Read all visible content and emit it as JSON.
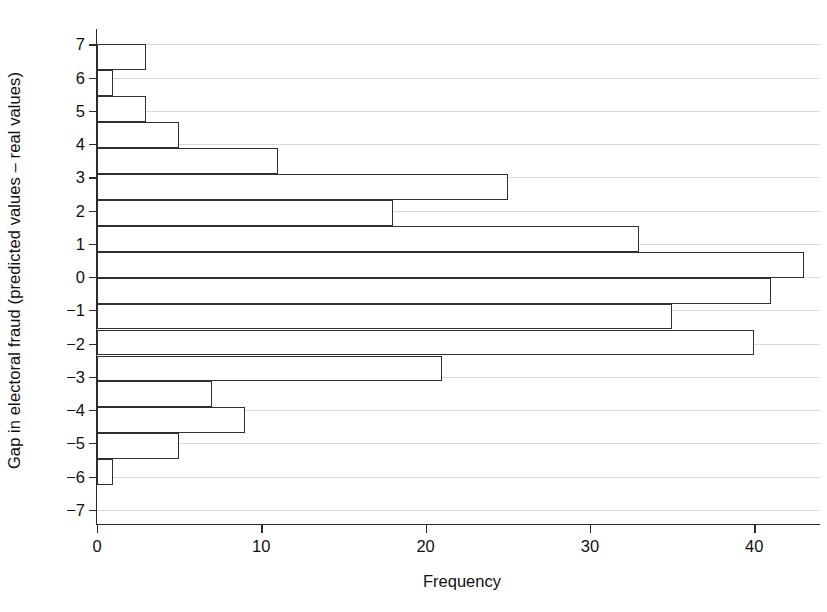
{
  "chart_data": {
    "type": "bar",
    "orientation": "horizontal",
    "title": "",
    "xlabel": "Frequency",
    "ylabel": "Gap in electoral fraud (predicted values – real values)",
    "xlim": [
      0,
      44
    ],
    "ylim": [
      -7.4,
      7.4
    ],
    "xticks": [
      0,
      10,
      20,
      30,
      40
    ],
    "xtick_labels": [
      "0",
      "10",
      "20",
      "30",
      "40"
    ],
    "yticks": [
      7,
      6,
      5,
      4,
      3,
      2,
      1,
      0,
      -1,
      -2,
      -3,
      -4,
      -5,
      -6,
      -7
    ],
    "ytick_labels": [
      "7",
      "6",
      "5",
      "4",
      "3",
      "2",
      "1",
      "0",
      "−1",
      "−2",
      "−3",
      "−4",
      "−5",
      "−6",
      "−7"
    ],
    "grid": true,
    "grid_axis": "y",
    "grid_color": "#dadada",
    "bar_edge_color": "#2f2f2f",
    "bar_fill_color": "#ffffff",
    "legend": null,
    "bin_width": 0.78,
    "bins": [
      {
        "center": 6.6,
        "low": 6.22,
        "high": 7.0,
        "value": 3
      },
      {
        "center": 5.83,
        "low": 5.44,
        "high": 6.22,
        "value": 1
      },
      {
        "center": 5.05,
        "low": 4.66,
        "high": 5.44,
        "value": 3
      },
      {
        "center": 4.27,
        "low": 3.88,
        "high": 4.66,
        "value": 5
      },
      {
        "center": 3.49,
        "low": 3.1,
        "high": 3.88,
        "value": 11
      },
      {
        "center": 2.71,
        "low": 2.32,
        "high": 3.1,
        "value": 25
      },
      {
        "center": 1.93,
        "low": 1.54,
        "high": 2.32,
        "value": 18
      },
      {
        "center": 1.15,
        "low": 0.76,
        "high": 1.54,
        "value": 33
      },
      {
        "center": 0.37,
        "low": -0.02,
        "high": 0.76,
        "value": 43
      },
      {
        "center": -0.41,
        "low": -0.8,
        "high": -0.02,
        "value": 41
      },
      {
        "center": -1.19,
        "low": -1.58,
        "high": -0.8,
        "value": 35
      },
      {
        "center": -1.97,
        "low": -2.36,
        "high": -1.58,
        "value": 40
      },
      {
        "center": -2.75,
        "low": -3.14,
        "high": -2.36,
        "value": 21
      },
      {
        "center": -3.53,
        "low": -3.92,
        "high": -3.14,
        "value": 7
      },
      {
        "center": -4.31,
        "low": -4.7,
        "high": -3.92,
        "value": 9
      },
      {
        "center": -5.09,
        "low": -5.48,
        "high": -4.7,
        "value": 5
      },
      {
        "center": -5.87,
        "low": -6.26,
        "high": -5.48,
        "value": 1
      }
    ]
  }
}
